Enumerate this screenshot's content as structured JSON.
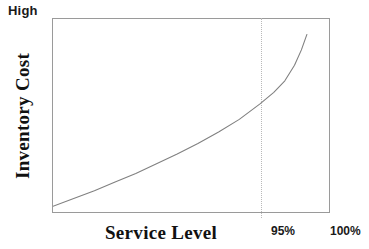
{
  "chart_data": {
    "type": "line",
    "title": "",
    "subtitle": "",
    "xlabel": "Service Level",
    "ylabel": "Inventory Cost",
    "axis_top_annotation": "High",
    "grid": false,
    "legend": null,
    "xlim": [
      80,
      100
    ],
    "ylim": [
      0,
      100
    ],
    "xtick_labels": [
      "95%",
      "100%"
    ],
    "xtick_values": [
      95,
      100
    ],
    "ytick_labels": [
      "High"
    ],
    "series": [
      {
        "name": "Inventory Cost vs Service Level",
        "color": "#808080",
        "x": [
          80.0,
          81.5,
          83.0,
          84.5,
          86.0,
          87.5,
          89.0,
          90.5,
          92.0,
          93.5,
          95.0,
          96.0,
          96.8,
          97.5,
          98.0,
          98.4
        ],
        "y": [
          3.0,
          7.0,
          11.0,
          15.5,
          20.0,
          25.0,
          30.0,
          35.5,
          41.5,
          48.0,
          56.0,
          62.0,
          68.0,
          76.0,
          84.0,
          92.0
        ]
      }
    ],
    "annotations": [
      {
        "name": "reference-line-95",
        "type": "vertical-dotted-line",
        "x": 95,
        "label": "95%",
        "color": "#b9b9b9"
      }
    ]
  },
  "labels": {
    "high": "High",
    "ylabel": "Inventory Cost",
    "xlabel": "Service Level",
    "tick_95": "95%",
    "tick_100": "100%"
  },
  "colors": {
    "curve": "#808080",
    "frame": "#9a9a9a",
    "reference_line": "#b9b9b9",
    "text": "#111111",
    "background": "#ffffff"
  }
}
